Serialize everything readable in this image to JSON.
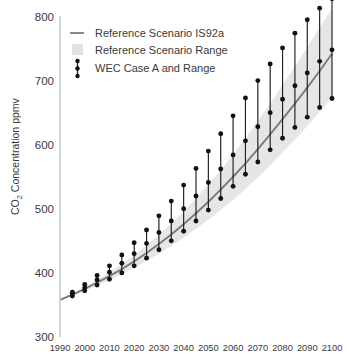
{
  "chart_data": {
    "type": "line",
    "title": "",
    "xlabel": "",
    "ylabel": "CO2 Concentration ppmv",
    "ylabel_main": "CO",
    "ylabel_sub": "2",
    "ylabel_rest": " Concentration ppmv",
    "xlim": [
      1990,
      2100
    ],
    "ylim": [
      300,
      800
    ],
    "yticks": [
      300,
      400,
      500,
      600,
      700,
      800
    ],
    "xticks": [
      1990,
      2000,
      2010,
      2020,
      2030,
      2040,
      2050,
      2060,
      2070,
      2080,
      2090,
      2100
    ],
    "grid": false,
    "legend_position": "top-left",
    "colors": {
      "reference_line": "#7a7a7a",
      "reference_band": "#e6e6e6",
      "wec_marker": "#111111",
      "axis": "#c8c8c8",
      "text": "#3a3a3a",
      "background": "#ffffff"
    },
    "series": [
      {
        "name": "Reference Scenario IS92a",
        "type": "line",
        "x": [
          1990,
          1995,
          2000,
          2005,
          2010,
          2015,
          2020,
          2025,
          2030,
          2035,
          2040,
          2045,
          2050,
          2055,
          2060,
          2065,
          2070,
          2075,
          2080,
          2085,
          2090,
          2095,
          2100
        ],
        "values": [
          358,
          366,
          375,
          385,
          395,
          406,
          418,
          431,
          445,
          460,
          476,
          493,
          511,
          530,
          550,
          571,
          593,
          616,
          640,
          664,
          689,
          715,
          742
        ]
      },
      {
        "name": "Reference Scenario Range",
        "type": "band",
        "x": [
          1990,
          1995,
          2000,
          2005,
          2010,
          2015,
          2020,
          2025,
          2030,
          2035,
          2040,
          2045,
          2050,
          2055,
          2060,
          2065,
          2070,
          2075,
          2080,
          2085,
          2090,
          2095,
          2100
        ],
        "lower": [
          357,
          364,
          372,
          380,
          389,
          398,
          408,
          419,
          430,
          442,
          455,
          469,
          483,
          498,
          514,
          531,
          549,
          568,
          588,
          608,
          629,
          651,
          674
        ],
        "upper": [
          359,
          368,
          378,
          389,
          401,
          414,
          428,
          443,
          459,
          477,
          496,
          516,
          538,
          561,
          585,
          610,
          637,
          664,
          693,
          722,
          752,
          783,
          812
        ]
      },
      {
        "name": "WEC Case A and Range",
        "type": "errorbar",
        "x": [
          1995,
          2000,
          2005,
          2010,
          2015,
          2020,
          2025,
          2030,
          2035,
          2040,
          2045,
          2050,
          2055,
          2060,
          2065,
          2070,
          2075,
          2080,
          2085,
          2090,
          2095,
          2100
        ],
        "values": [
          367,
          377,
          389,
          401,
          415,
          430,
          446,
          463,
          481,
          500,
          520,
          541,
          562,
          584,
          606,
          628,
          650,
          671,
          692,
          712,
          730,
          748
        ],
        "lower": [
          364,
          372,
          381,
          390,
          400,
          411,
          423,
          436,
          450,
          465,
          481,
          498,
          516,
          535,
          554,
          573,
          592,
          610,
          627,
          643,
          658,
          672
        ],
        "upper": [
          370,
          382,
          396,
          411,
          428,
          447,
          467,
          489,
          512,
          537,
          563,
          590,
          617,
          645,
          673,
          700,
          726,
          751,
          774,
          795,
          813,
          828
        ]
      }
    ],
    "legend_entries": [
      {
        "label": "Reference Scenario IS92a",
        "symbol": "line"
      },
      {
        "label": "Reference Scenario Range",
        "symbol": "swatch"
      },
      {
        "label": "WEC Case A and Range",
        "symbol": "errorbar"
      }
    ]
  }
}
